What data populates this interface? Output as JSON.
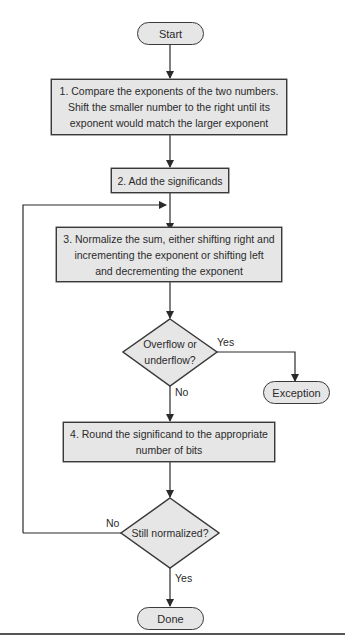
{
  "flowchart": {
    "start": "Start",
    "step1": [
      "1.  Compare the exponents of the two numbers.",
      "Shift the smaller number to the right until its",
      "exponent would match the larger exponent"
    ],
    "step2": "2. Add the significands",
    "step3": [
      "3. Normalize the sum, either shifting right and",
      "incrementing the exponent or shifting left",
      "and decrementing the exponent"
    ],
    "decision1": [
      "Overflow or",
      "underflow?"
    ],
    "decision1_yes": "Yes",
    "decision1_no": "No",
    "exception": "Exception",
    "step4": [
      "4. Round the significand to the appropriate",
      "number of bits"
    ],
    "decision2": "Still normalized?",
    "decision2_no": "No",
    "decision2_yes": "Yes",
    "done": "Done"
  },
  "colors": {
    "fill": "#e6e6e6",
    "stroke": "#3a3a3a"
  }
}
